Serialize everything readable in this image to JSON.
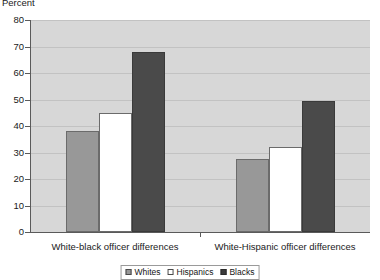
{
  "chart_data": {
    "type": "bar",
    "title": "",
    "subtitle": "",
    "xlabel": "",
    "ylabel": "Percent",
    "ylim": [
      0,
      80
    ],
    "ytick_step": 10,
    "yticks": [
      "0",
      "10",
      "20",
      "30",
      "40",
      "50",
      "60",
      "70",
      "80"
    ],
    "grid": true,
    "grid_axis": "y",
    "legend_position": "bottom-center",
    "categories": [
      "White-black officer differences",
      "White-Hispanic officer differences"
    ],
    "series": [
      {
        "name": "Whites",
        "values": [
          38,
          27.5
        ],
        "color": "#989898"
      },
      {
        "name": "Hispanics",
        "values": [
          45,
          32
        ],
        "color": "#ffffff"
      },
      {
        "name": "Blacks",
        "values": [
          68,
          49.5
        ],
        "color": "#4a4a4a"
      }
    ]
  },
  "legend": {
    "items": [
      {
        "label": "Whites",
        "swatch": "legend-swatch-whites"
      },
      {
        "label": "Hispanics",
        "swatch": "legend-swatch-hispanics"
      },
      {
        "label": "Blacks",
        "swatch": "legend-swatch-blacks"
      }
    ]
  },
  "colors": {
    "plot_background": "#d7d7d7",
    "gridline": "#c2c2c2",
    "axis": "#5a5a5a",
    "whites": "#989898",
    "hispanics": "#ffffff",
    "blacks": "#4a4a4a",
    "text": "#1a1a1a"
  }
}
